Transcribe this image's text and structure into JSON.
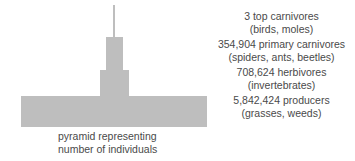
{
  "figure": {
    "pyramid": {
      "caption_lines": [
        "pyramid representing",
        "number of individuals"
      ],
      "fill_color": "#bebebe",
      "text_color": "#4a4a4a",
      "background_color": "#ffffff"
    },
    "legend": [
      {
        "primary": "3 top carnivores",
        "secondary": "(birds, moles)"
      },
      {
        "primary": "354,904 primary carnivores",
        "secondary": "(spiders, ants, beetles)"
      },
      {
        "primary": "708,624 herbivores",
        "secondary": "(invertebrates)"
      },
      {
        "primary": "5,842,424 producers",
        "secondary": "(grasses, weeds)"
      }
    ]
  },
  "chart_data": {
    "type": "bar",
    "title": "pyramid representing number of individuals",
    "xlabel": "",
    "ylabel": "",
    "orientation": "horizontal-centered",
    "categories": [
      "top carnivores",
      "primary carnivores",
      "herbivores",
      "producers"
    ],
    "values": [
      3,
      354904,
      708624,
      5842424
    ],
    "value_labels": [
      "3 top carnivores",
      "354,904 primary carnivores",
      "708,624 herbivores",
      "5,842,424 producers"
    ],
    "category_examples": [
      "(birds, moles)",
      "(spiders, ants, beetles)",
      "(invertebrates)",
      "(grasses, weeds)"
    ],
    "bar_widths_px": [
      2,
      17,
      29,
      186
    ],
    "bar_heights_px": [
      32,
      33,
      26,
      31
    ],
    "grid": false,
    "legend_position": "right",
    "series_color": "#bebebe"
  }
}
